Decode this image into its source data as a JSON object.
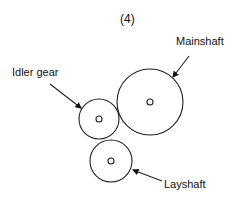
{
  "figure": {
    "number_label": "(4)",
    "labels": {
      "mainshaft": "Mainshaft",
      "idler": "Idler gear",
      "layshaft": "Layshaft"
    },
    "gears": [
      {
        "name": "Mainshaft",
        "cx": 150,
        "cy": 102,
        "r": 33
      },
      {
        "name": "Idler gear",
        "cx": 99,
        "cy": 119,
        "r": 20
      },
      {
        "name": "Layshaft",
        "cx": 111,
        "cy": 161,
        "r": 21
      }
    ]
  }
}
